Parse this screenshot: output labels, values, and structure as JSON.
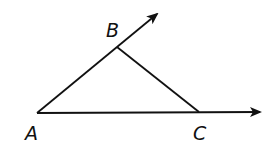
{
  "diagram": {
    "type": "triangle-with-rays",
    "points": {
      "A": {
        "label": "A",
        "x": 37,
        "y": 113
      },
      "B": {
        "label": "B",
        "x": 117,
        "y": 47
      },
      "C": {
        "label": "C",
        "x": 199,
        "y": 112
      }
    },
    "rays": [
      {
        "from": "A",
        "through": "B",
        "tip": {
          "x": 157,
          "y": 13
        }
      },
      {
        "from": "A",
        "through": "C",
        "tip": {
          "x": 261,
          "y": 112
        }
      }
    ],
    "segments": [
      {
        "from": "B",
        "to": "C"
      }
    ],
    "labels": {
      "A": "A",
      "B": "B",
      "C": "C"
    },
    "stroke_color": "#111111"
  }
}
